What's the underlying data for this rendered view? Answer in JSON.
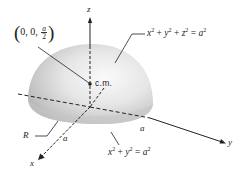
{
  "figure": {
    "labels": {
      "z_axis": "z",
      "x_axis": "x",
      "y_axis": "y",
      "centroid_point": {
        "open": "(",
        "coords": "0, 0,",
        "frac_num": "a",
        "frac_den": "2",
        "close": ")"
      },
      "center_of_mass": "c.m.",
      "sphere_equation": {
        "t1": "x",
        "e1": "2",
        "p1": " + ",
        "t2": "y",
        "e2": "2",
        "p2": " + ",
        "t3": "z",
        "e3": "2",
        "eq": " = ",
        "t4": "a",
        "e4": "2"
      },
      "base_equation": {
        "t1": "x",
        "e1": "2",
        "p1": " + ",
        "t2": "y",
        "e2": "2",
        "eq": " = ",
        "t3": "a",
        "e3": "2"
      },
      "region": "R",
      "radius_x": "a",
      "radius_y": "a"
    },
    "colors": {
      "line": "#222222",
      "surface_light": "#f4f4f4",
      "surface_dark": "#a8a8a8"
    }
  }
}
